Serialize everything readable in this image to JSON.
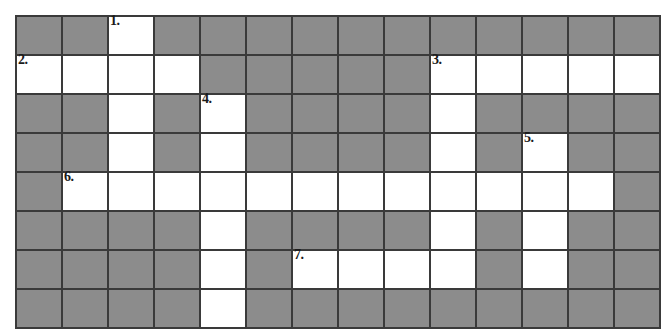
{
  "puzzle": {
    "title": "Crossword Puzzle Grid",
    "columns": 14,
    "rows": 8,
    "colors": {
      "block": "#8c8c8c",
      "open": "#ffffff",
      "border": "#3a3a3a",
      "number": "#1a1a1a",
      "page_background": "#ffffff"
    },
    "clue_numbers": [
      "1.",
      "2.",
      "3.",
      "4.",
      "5.",
      "6.",
      "7."
    ],
    "grid": [
      [
        {
          "type": "block",
          "num": null
        },
        {
          "type": "block",
          "num": null
        },
        {
          "type": "open",
          "num": "1."
        },
        {
          "type": "block",
          "num": null
        },
        {
          "type": "block",
          "num": null
        },
        {
          "type": "block",
          "num": null
        },
        {
          "type": "block",
          "num": null
        },
        {
          "type": "block",
          "num": null
        },
        {
          "type": "block",
          "num": null
        },
        {
          "type": "block",
          "num": null
        },
        {
          "type": "block",
          "num": null
        },
        {
          "type": "block",
          "num": null
        },
        {
          "type": "block",
          "num": null
        },
        {
          "type": "block",
          "num": null
        }
      ],
      [
        {
          "type": "open",
          "num": "2."
        },
        {
          "type": "open",
          "num": null
        },
        {
          "type": "open",
          "num": null
        },
        {
          "type": "open",
          "num": null
        },
        {
          "type": "block",
          "num": null
        },
        {
          "type": "block",
          "num": null
        },
        {
          "type": "block",
          "num": null
        },
        {
          "type": "block",
          "num": null
        },
        {
          "type": "block",
          "num": null
        },
        {
          "type": "open",
          "num": "3."
        },
        {
          "type": "open",
          "num": null
        },
        {
          "type": "open",
          "num": null
        },
        {
          "type": "open",
          "num": null
        },
        {
          "type": "open",
          "num": null
        }
      ],
      [
        {
          "type": "block",
          "num": null
        },
        {
          "type": "block",
          "num": null
        },
        {
          "type": "open",
          "num": null
        },
        {
          "type": "block",
          "num": null
        },
        {
          "type": "open",
          "num": "4."
        },
        {
          "type": "block",
          "num": null
        },
        {
          "type": "block",
          "num": null
        },
        {
          "type": "block",
          "num": null
        },
        {
          "type": "block",
          "num": null
        },
        {
          "type": "open",
          "num": null
        },
        {
          "type": "block",
          "num": null
        },
        {
          "type": "block",
          "num": null
        },
        {
          "type": "block",
          "num": null
        },
        {
          "type": "block",
          "num": null
        }
      ],
      [
        {
          "type": "block",
          "num": null
        },
        {
          "type": "block",
          "num": null
        },
        {
          "type": "open",
          "num": null
        },
        {
          "type": "block",
          "num": null
        },
        {
          "type": "open",
          "num": null
        },
        {
          "type": "block",
          "num": null
        },
        {
          "type": "block",
          "num": null
        },
        {
          "type": "block",
          "num": null
        },
        {
          "type": "block",
          "num": null
        },
        {
          "type": "open",
          "num": null
        },
        {
          "type": "block",
          "num": null
        },
        {
          "type": "open",
          "num": "5."
        },
        {
          "type": "block",
          "num": null
        },
        {
          "type": "block",
          "num": null
        }
      ],
      [
        {
          "type": "block",
          "num": null
        },
        {
          "type": "open",
          "num": "6."
        },
        {
          "type": "open",
          "num": null
        },
        {
          "type": "open",
          "num": null
        },
        {
          "type": "open",
          "num": null
        },
        {
          "type": "open",
          "num": null
        },
        {
          "type": "open",
          "num": null
        },
        {
          "type": "open",
          "num": null
        },
        {
          "type": "open",
          "num": null
        },
        {
          "type": "open",
          "num": null
        },
        {
          "type": "open",
          "num": null
        },
        {
          "type": "open",
          "num": null
        },
        {
          "type": "open",
          "num": null
        },
        {
          "type": "block",
          "num": null
        }
      ],
      [
        {
          "type": "block",
          "num": null
        },
        {
          "type": "block",
          "num": null
        },
        {
          "type": "block",
          "num": null
        },
        {
          "type": "block",
          "num": null
        },
        {
          "type": "open",
          "num": null
        },
        {
          "type": "block",
          "num": null
        },
        {
          "type": "block",
          "num": null
        },
        {
          "type": "block",
          "num": null
        },
        {
          "type": "block",
          "num": null
        },
        {
          "type": "open",
          "num": null
        },
        {
          "type": "block",
          "num": null
        },
        {
          "type": "open",
          "num": null
        },
        {
          "type": "block",
          "num": null
        },
        {
          "type": "block",
          "num": null
        }
      ],
      [
        {
          "type": "block",
          "num": null
        },
        {
          "type": "block",
          "num": null
        },
        {
          "type": "block",
          "num": null
        },
        {
          "type": "block",
          "num": null
        },
        {
          "type": "open",
          "num": null
        },
        {
          "type": "block",
          "num": null
        },
        {
          "type": "open",
          "num": "7."
        },
        {
          "type": "open",
          "num": null
        },
        {
          "type": "open",
          "num": null
        },
        {
          "type": "open",
          "num": null
        },
        {
          "type": "block",
          "num": null
        },
        {
          "type": "open",
          "num": null
        },
        {
          "type": "block",
          "num": null
        },
        {
          "type": "block",
          "num": null
        }
      ],
      [
        {
          "type": "block",
          "num": null
        },
        {
          "type": "block",
          "num": null
        },
        {
          "type": "block",
          "num": null
        },
        {
          "type": "block",
          "num": null
        },
        {
          "type": "open",
          "num": null
        },
        {
          "type": "block",
          "num": null
        },
        {
          "type": "block",
          "num": null
        },
        {
          "type": "block",
          "num": null
        },
        {
          "type": "block",
          "num": null
        },
        {
          "type": "block",
          "num": null
        },
        {
          "type": "block",
          "num": null
        },
        {
          "type": "block",
          "num": null
        },
        {
          "type": "block",
          "num": null
        },
        {
          "type": "block",
          "num": null
        }
      ]
    ]
  }
}
